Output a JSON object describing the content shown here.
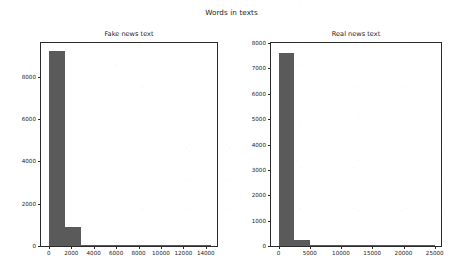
{
  "figure": {
    "suptitle": "Words in texts",
    "width": 463,
    "height": 275,
    "background_color": "#ffffff",
    "bar_color": "#5a5a5a",
    "axis_color": "#2b2b2b"
  },
  "chart_data": [
    {
      "type": "bar",
      "id": "fake-news-text",
      "title": "Fake news text",
      "xlabel": "",
      "ylabel": "",
      "grid": false,
      "legend": null,
      "xlim": [
        -700,
        15000
      ],
      "ylim": [
        0,
        9600
      ],
      "xticks": [
        0,
        2000,
        4000,
        6000,
        8000,
        10000,
        12000,
        14000
      ],
      "xtick_labels": [
        "0",
        "2000",
        "4000",
        "6000",
        "8000",
        "10000",
        "12000",
        "14000"
      ],
      "yticks": [
        0,
        2000,
        4000,
        6000,
        8000
      ],
      "ytick_labels": [
        "0",
        "2000",
        "4000",
        "6000",
        "8000"
      ],
      "bin_edges": [
        0,
        1450,
        2900,
        4350,
        5800,
        7250,
        8700,
        10150,
        11600,
        13050,
        14500
      ],
      "values": [
        9200,
        900,
        60,
        20,
        10,
        6,
        4,
        3,
        2,
        2
      ],
      "categories": [
        "0-1450",
        "1450-2900",
        "2900-4350",
        "4350-5800",
        "5800-7250",
        "7250-8700",
        "8700-10150",
        "10150-11600",
        "11600-13050",
        "13050-14500"
      ]
    },
    {
      "type": "bar",
      "id": "real-news-text",
      "title": "Real news text",
      "xlabel": "",
      "ylabel": "",
      "grid": false,
      "legend": null,
      "xlim": [
        -1200,
        26000
      ],
      "ylim": [
        0,
        8000
      ],
      "xticks": [
        0,
        5000,
        10000,
        15000,
        20000,
        25000
      ],
      "xtick_labels": [
        "0",
        "5000",
        "10000",
        "15000",
        "20000",
        "25000"
      ],
      "yticks": [
        0,
        1000,
        2000,
        3000,
        4000,
        5000,
        6000,
        7000,
        8000
      ],
      "ytick_labels": [
        "0",
        "1000",
        "2000",
        "3000",
        "4000",
        "5000",
        "6000",
        "7000",
        "8000"
      ],
      "bin_edges": [
        0,
        2500,
        5000,
        7500,
        10000,
        12500,
        15000,
        17500,
        20000,
        22500,
        25000
      ],
      "values": [
        7600,
        250,
        40,
        15,
        8,
        5,
        3,
        2,
        2,
        1
      ],
      "categories": [
        "0-2500",
        "2500-5000",
        "5000-7500",
        "7500-10000",
        "10000-12500",
        "12500-15000",
        "15000-17500",
        "17500-20000",
        "20000-22500",
        "22500-25000"
      ]
    }
  ]
}
